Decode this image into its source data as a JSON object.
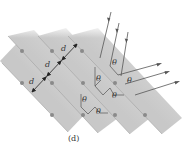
{
  "figure": {
    "caption": "(d)",
    "spacing_label": "d",
    "angle_label": "θ",
    "colors": {
      "band_light": "#f4f4f4",
      "band_dark": "#c9c9c9",
      "atom": "#8a8a8a",
      "ray": "#555555",
      "text": "#333333"
    }
  },
  "bands": [
    {
      "id": 0
    },
    {
      "id": 1
    },
    {
      "id": 2
    },
    {
      "id": 3
    }
  ],
  "spacing_labels": [
    "d",
    "d",
    "d"
  ],
  "angle_labels": [
    "θ",
    "θ",
    "θ",
    "θ",
    "θ",
    "θ"
  ],
  "incident_rays": 3,
  "reflected_rays": 3
}
